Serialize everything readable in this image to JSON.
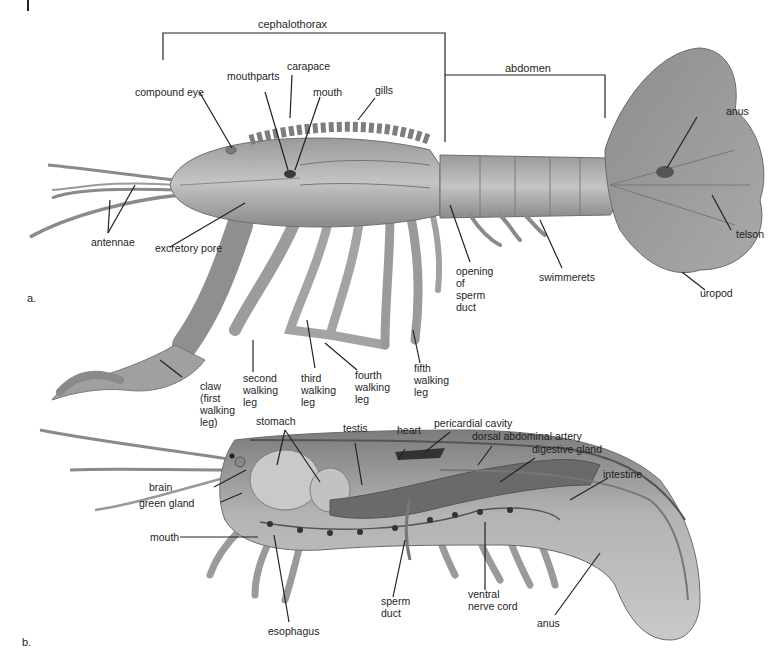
{
  "figure": {
    "panel_labels": [
      "a.",
      "b."
    ],
    "colors": {
      "ink": "#1e1e1e",
      "body_light": "#b9b9b9",
      "body_mid": "#8f8f8f",
      "body_dark": "#5e5e5e",
      "background": "#ffffff"
    }
  },
  "panel_a": {
    "brackets": {
      "cephalothorax": "cephalothorax",
      "abdomen": "abdomen"
    },
    "labels": {
      "compound_eye": "compound eye",
      "mouthparts": "mouthparts",
      "carapace": "carapace",
      "mouth": "mouth",
      "gills": "gills",
      "anus": "anus",
      "antennae": "antennae",
      "excretory_pore": "excretory pore",
      "opening_sperm_duct": "opening\nof\nsperm\nduct",
      "swimmerets": "swimmerets",
      "telson": "telson",
      "uropod": "uropod",
      "claw": "claw\n(first\nwalking\nleg)",
      "second_leg": "second\nwalking\nleg",
      "third_leg": "third\nwalking\nleg",
      "fourth_leg": "fourth\nwalking\nleg",
      "fifth_leg": "fifth\nwalking\nleg"
    }
  },
  "panel_b": {
    "labels": {
      "stomach": "stomach",
      "testis": "testis",
      "heart": "heart",
      "pericardial_cavity": "pericardial cavity",
      "dorsal_abdominal_artery": "dorsal abdominal artery",
      "digestive_gland": "digestive gland",
      "intestine": "intestine",
      "brain": "brain",
      "green_gland": "green gland",
      "mouth": "mouth",
      "esophagus": "esophagus",
      "sperm_duct": "sperm\nduct",
      "ventral_nerve_cord": "ventral\nnerve cord",
      "anus": "anus"
    }
  }
}
